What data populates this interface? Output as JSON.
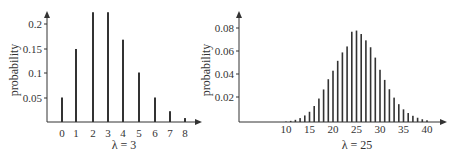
{
  "chart_data": [
    {
      "type": "bar",
      "title": "",
      "xlabel": "λ = 3",
      "ylabel": "probability",
      "ylim": [
        0,
        0.22
      ],
      "yticks": [
        "0.05",
        "0.1",
        "0.15",
        "0.2"
      ],
      "categories": [
        "0",
        "1",
        "2",
        "3",
        "4",
        "5",
        "6",
        "7",
        "8"
      ],
      "values": [
        0.05,
        0.149,
        0.224,
        0.224,
        0.168,
        0.101,
        0.05,
        0.022,
        0.008
      ],
      "grid": false
    },
    {
      "type": "bar",
      "title": "",
      "xlabel": "λ = 25",
      "ylabel": "probability",
      "ylim": [
        0,
        0.085
      ],
      "yticks": [
        "0.02",
        "0.04",
        "0.06",
        "0.08"
      ],
      "xticks": [
        "10",
        "15",
        "20",
        "25",
        "30",
        "35",
        "40"
      ],
      "categories": [
        "10",
        "11",
        "12",
        "13",
        "14",
        "15",
        "16",
        "17",
        "18",
        "19",
        "20",
        "21",
        "22",
        "23",
        "24",
        "25",
        "26",
        "27",
        "28",
        "29",
        "30",
        "31",
        "32",
        "33",
        "34",
        "35",
        "36",
        "37",
        "38",
        "39",
        "40"
      ],
      "values": [
        0.0004,
        0.001,
        0.0019,
        0.0034,
        0.0057,
        0.0089,
        0.0139,
        0.0204,
        0.0283,
        0.0372,
        0.0446,
        0.0532,
        0.0605,
        0.0657,
        0.0785,
        0.0795,
        0.0765,
        0.071,
        0.065,
        0.056,
        0.0454,
        0.0366,
        0.0285,
        0.0212,
        0.0155,
        0.011,
        0.0078,
        0.0054,
        0.0037,
        0.0024,
        0.0015
      ],
      "grid": false
    }
  ],
  "left": {
    "ylabel": "probability",
    "xlabel": "λ = 3",
    "yticks": [
      "0.05",
      "0.1",
      "0.15",
      "0.2"
    ],
    "xticks": [
      "0",
      "1",
      "2",
      "3",
      "4",
      "5",
      "6",
      "7",
      "8"
    ]
  },
  "right": {
    "ylabel": "probability",
    "xlabel": "λ = 25",
    "yticks": [
      "0.02",
      "0.04",
      "0.06",
      "0.08"
    ],
    "xticks": [
      "10",
      "15",
      "20",
      "25",
      "30",
      "35",
      "40"
    ]
  },
  "colors": {
    "axis": "#333333",
    "bar": "#333333",
    "text": "#333333"
  }
}
